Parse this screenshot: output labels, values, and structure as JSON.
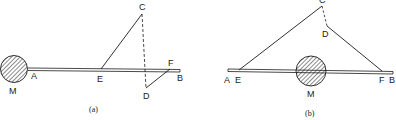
{
  "figure": {
    "panels": [
      {
        "id": "a",
        "caption": "(a)",
        "labels": {
          "M": "M",
          "A": "A",
          "E": "E",
          "C": "C",
          "D": "D",
          "F": "F",
          "B": "B"
        }
      },
      {
        "id": "b",
        "caption": "(b)",
        "labels": {
          "M": "M",
          "A": "A",
          "E": "E",
          "C": "C",
          "D": "D",
          "F": "F",
          "B": "B"
        }
      }
    ],
    "colors": {
      "ink": "#1a1a1a",
      "background": "#ffffff"
    }
  }
}
